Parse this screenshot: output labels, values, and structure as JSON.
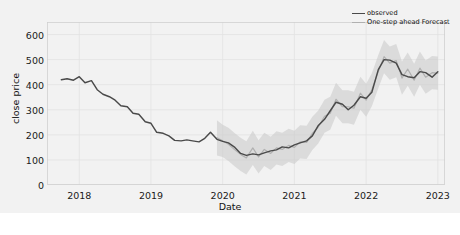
{
  "chart_data": {
    "type": "line",
    "title": "",
    "xlabel": "Date",
    "ylabel": "close price",
    "ylim": [
      0,
      650
    ],
    "xlim": [
      2017.55,
      2023.1
    ],
    "grid": true,
    "yticks": [
      0,
      100,
      200,
      300,
      400,
      500,
      600
    ],
    "xticks": [
      "2018",
      "2019",
      "2020",
      "2021",
      "2022",
      "2023"
    ],
    "xtick_values": [
      2018,
      2019,
      2020,
      2021,
      2022,
      2023
    ],
    "legend": {
      "position": "upper right",
      "entries": [
        {
          "label": "observed",
          "color": "#4a4a4a"
        },
        {
          "label": "One-step ahead Forecast",
          "color": "#b0b0b0"
        }
      ]
    },
    "band": {
      "label": "confidence interval",
      "color": "#c8c8c8",
      "opacity": 0.55,
      "starts_at": 2019.95
    },
    "x": [
      2017.75,
      2017.83,
      2017.92,
      2018.0,
      2018.08,
      2018.17,
      2018.25,
      2018.33,
      2018.42,
      2018.5,
      2018.58,
      2018.67,
      2018.75,
      2018.83,
      2018.92,
      2019.0,
      2019.08,
      2019.17,
      2019.25,
      2019.33,
      2019.42,
      2019.5,
      2019.58,
      2019.67,
      2019.75,
      2019.83,
      2019.92,
      2020.0,
      2020.08,
      2020.17,
      2020.25,
      2020.33,
      2020.42,
      2020.5,
      2020.58,
      2020.67,
      2020.75,
      2020.83,
      2020.92,
      2021.0,
      2021.08,
      2021.17,
      2021.25,
      2021.33,
      2021.42,
      2021.5,
      2021.58,
      2021.67,
      2021.75,
      2021.83,
      2021.92,
      2022.0,
      2022.08,
      2022.17,
      2022.25,
      2022.33,
      2022.42,
      2022.5,
      2022.58,
      2022.67,
      2022.75,
      2022.83,
      2022.92,
      2023.0
    ],
    "series": [
      {
        "name": "observed",
        "color": "#4a4a4a",
        "values": [
          420,
          424,
          418,
          432,
          408,
          416,
          380,
          362,
          352,
          338,
          316,
          312,
          286,
          282,
          252,
          246,
          210,
          206,
          196,
          178,
          176,
          180,
          176,
          172,
          186,
          210,
          182,
          174,
          168,
          150,
          126,
          118,
          124,
          120,
          128,
          136,
          140,
          152,
          148,
          160,
          168,
          176,
          196,
          236,
          262,
          296,
          330,
          322,
          300,
          318,
          352,
          346,
          370,
          460,
          500,
          498,
          486,
          440,
          432,
          428,
          452,
          448,
          430,
          452
        ]
      },
      {
        "name": "One-step ahead Forecast",
        "color": "#b0b0b0",
        "values": [
          null,
          null,
          null,
          null,
          null,
          null,
          null,
          null,
          null,
          null,
          null,
          null,
          null,
          null,
          null,
          null,
          null,
          null,
          null,
          null,
          null,
          null,
          null,
          null,
          null,
          null,
          188,
          176,
          162,
          140,
          122,
          108,
          148,
          112,
          142,
          126,
          148,
          142,
          158,
          150,
          172,
          170,
          206,
          230,
          274,
          286,
          342,
          312,
          312,
          306,
          366,
          338,
          380,
          452,
          512,
          486,
          496,
          426,
          462,
          418,
          466,
          430,
          448,
          446
        ]
      }
    ],
    "band_lower": [
      null,
      null,
      null,
      null,
      null,
      null,
      null,
      null,
      null,
      null,
      null,
      null,
      null,
      null,
      null,
      null,
      null,
      null,
      null,
      null,
      null,
      null,
      null,
      null,
      null,
      null,
      118,
      112,
      96,
      74,
      56,
      42,
      80,
      46,
      76,
      60,
      82,
      76,
      92,
      84,
      106,
      104,
      140,
      164,
      208,
      220,
      276,
      246,
      246,
      240,
      300,
      272,
      314,
      386,
      446,
      420,
      430,
      360,
      396,
      352,
      400,
      364,
      382,
      380
    ],
    "band_upper": [
      null,
      null,
      null,
      null,
      null,
      null,
      null,
      null,
      null,
      null,
      null,
      null,
      null,
      null,
      null,
      null,
      null,
      null,
      null,
      null,
      null,
      null,
      null,
      null,
      null,
      null,
      258,
      240,
      228,
      206,
      188,
      174,
      216,
      178,
      208,
      192,
      214,
      208,
      224,
      216,
      238,
      236,
      272,
      296,
      340,
      352,
      408,
      378,
      378,
      372,
      432,
      404,
      446,
      518,
      578,
      552,
      562,
      492,
      528,
      484,
      532,
      496,
      514,
      512
    ]
  }
}
